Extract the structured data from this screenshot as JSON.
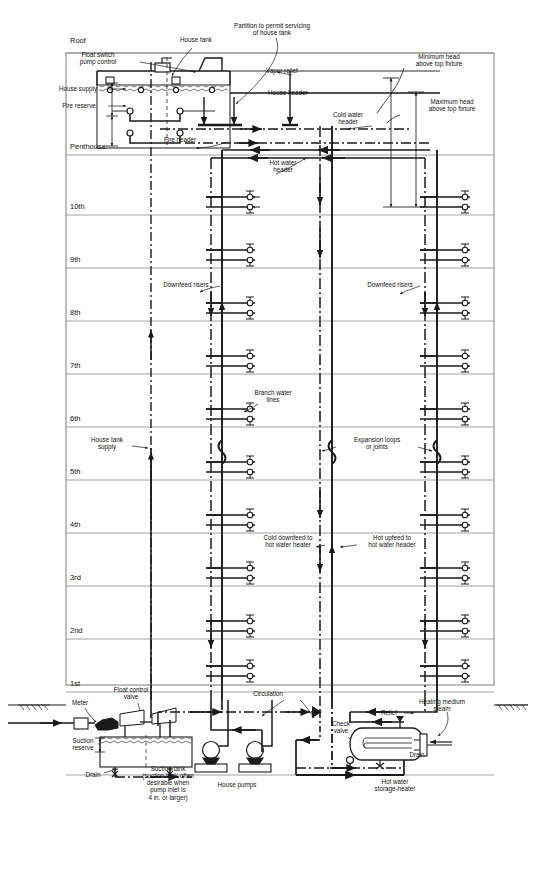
{
  "diagram": {
    "type": "schematic",
    "stroke_color": "#1a1a1a",
    "floorline_color": "#8c8c8c",
    "background": "#ffffff"
  },
  "floors": [
    {
      "id": "roof",
      "label": "Roof",
      "y": 42
    },
    {
      "id": "penthouse",
      "label": "Penthouse",
      "y": 148
    },
    {
      "id": "f10",
      "label": "10th",
      "y": 208
    },
    {
      "id": "f9",
      "label": "9th",
      "y": 261
    },
    {
      "id": "f8",
      "label": "8th",
      "y": 314
    },
    {
      "id": "f7",
      "label": "7th",
      "y": 367
    },
    {
      "id": "f6",
      "label": "6th",
      "y": 420
    },
    {
      "id": "f5",
      "label": "5th",
      "y": 473
    },
    {
      "id": "f4",
      "label": "4th",
      "y": 526
    },
    {
      "id": "f3",
      "label": "3rd",
      "y": 579
    },
    {
      "id": "f2",
      "label": "2nd",
      "y": 632
    },
    {
      "id": "f1",
      "label": "1st",
      "y": 685
    }
  ],
  "annotations": [
    {
      "id": "house-tank",
      "text": "House tank",
      "x": 196,
      "y": 40,
      "align": "center"
    },
    {
      "id": "partition",
      "text": "Partition to permit servicing\nof house tank",
      "x": 272,
      "y": 29,
      "align": "center"
    },
    {
      "id": "float-switch",
      "text": "Float switch\npump control",
      "x": 98,
      "y": 58,
      "align": "center"
    },
    {
      "id": "vapor-relief",
      "text": "Vapor relief",
      "x": 266,
      "y": 71,
      "align": "left"
    },
    {
      "id": "house-supply",
      "text": "House supply",
      "x": 78,
      "y": 89,
      "align": "center"
    },
    {
      "id": "fire-reserve",
      "text": "Fire reserve",
      "x": 79,
      "y": 106,
      "align": "center"
    },
    {
      "id": "house-header",
      "text": "House header",
      "x": 268,
      "y": 93,
      "align": "left"
    },
    {
      "id": "minimum-head",
      "text": "Minimum head\nabove top fixture",
      "x": 439,
      "y": 60,
      "align": "center"
    },
    {
      "id": "maximum-head",
      "text": "Maximum head\nabove top fixture",
      "x": 452,
      "y": 105,
      "align": "center"
    },
    {
      "id": "cold-water-header",
      "text": "Cold water\nheader",
      "x": 348,
      "y": 118,
      "align": "center"
    },
    {
      "id": "fire-header",
      "text": "Fire header",
      "x": 180,
      "y": 140,
      "align": "center"
    },
    {
      "id": "hot-water-header",
      "text": "Hot water\nheader",
      "x": 283,
      "y": 166,
      "align": "center"
    },
    {
      "id": "downfeed-risers-left",
      "text": "Downfeed risers",
      "x": 186,
      "y": 285,
      "align": "center"
    },
    {
      "id": "downfeed-risers-right",
      "text": "Downfeed risers",
      "x": 390,
      "y": 285,
      "align": "center"
    },
    {
      "id": "branch-water-lines",
      "text": "Branch water\nlines",
      "x": 273,
      "y": 396,
      "align": "center"
    },
    {
      "id": "house-tank-supply",
      "text": "House tank\nsupply",
      "x": 107,
      "y": 443,
      "align": "center"
    },
    {
      "id": "expansion-loops",
      "text": "Expansion loops\nor joints",
      "x": 377,
      "y": 443,
      "align": "center"
    },
    {
      "id": "cold-downfeed",
      "text": "Cold downfeed to\nhot water heater",
      "x": 288,
      "y": 541,
      "align": "center"
    },
    {
      "id": "hot-upfeed",
      "text": "Hot upfeed to\nhot water header",
      "x": 392,
      "y": 541,
      "align": "center"
    },
    {
      "id": "meter",
      "text": "Meter",
      "x": 80,
      "y": 703,
      "align": "center"
    },
    {
      "id": "float-control-valve",
      "text": "Float control\nvalve",
      "x": 131,
      "y": 693,
      "align": "center"
    },
    {
      "id": "suction-reserve",
      "text": "Suction\nreserve",
      "x": 83,
      "y": 744,
      "align": "center"
    },
    {
      "id": "drain-left",
      "text": "Drain",
      "x": 93,
      "y": 775,
      "align": "center"
    },
    {
      "id": "suction-tank",
      "text": "Suction tank\n(suction tank often\ndesirable when\npump inlet is\n4 in. or larger)",
      "x": 168,
      "y": 783,
      "align": "center"
    },
    {
      "id": "house-pumps",
      "text": "House pumps",
      "x": 237,
      "y": 785,
      "align": "center"
    },
    {
      "id": "circulation",
      "text": "Circulation",
      "x": 268,
      "y": 694,
      "align": "center"
    },
    {
      "id": "check-valve",
      "text": "Check\nvalve",
      "x": 341,
      "y": 727,
      "align": "center"
    },
    {
      "id": "relief",
      "text": "Relief",
      "x": 389,
      "y": 713,
      "align": "center"
    },
    {
      "id": "heating-medium",
      "text": "Heating medium\nsteam",
      "x": 442,
      "y": 705,
      "align": "center"
    },
    {
      "id": "drain-right",
      "text": "Drain",
      "x": 417,
      "y": 755,
      "align": "center"
    },
    {
      "id": "hot-water-storage",
      "text": "Hot water\nstorage-heater",
      "x": 395,
      "y": 785,
      "align": "center"
    }
  ],
  "risers": [
    {
      "id": "house-tank-supply-riser",
      "x": 151,
      "label": "House tank supply"
    },
    {
      "id": "left-downfeed-cold",
      "x": 211,
      "label": "Left downfeed riser"
    },
    {
      "id": "left-hot-riser",
      "x": 222,
      "label": "Left hot water riser"
    },
    {
      "id": "mid-cold-riser",
      "x": 320,
      "label": "Mid cold riser"
    },
    {
      "id": "mid-hot-riser",
      "x": 332,
      "label": "Mid hot riser"
    },
    {
      "id": "right-downfeed-cold",
      "x": 425,
      "label": "Right downfeed riser"
    },
    {
      "id": "right-hot-riser",
      "x": 437,
      "label": "Right hot riser"
    }
  ],
  "equipment": [
    {
      "id": "house-tank-vessel",
      "label": "House tank"
    },
    {
      "id": "suction-tank-vessel",
      "label": "Suction tank"
    },
    {
      "id": "pump-1",
      "label": "House pump 1"
    },
    {
      "id": "pump-2",
      "label": "House pump 2"
    },
    {
      "id": "water-meter",
      "label": "Water meter"
    },
    {
      "id": "heater-vessel",
      "label": "Hot water storage-heater"
    }
  ]
}
